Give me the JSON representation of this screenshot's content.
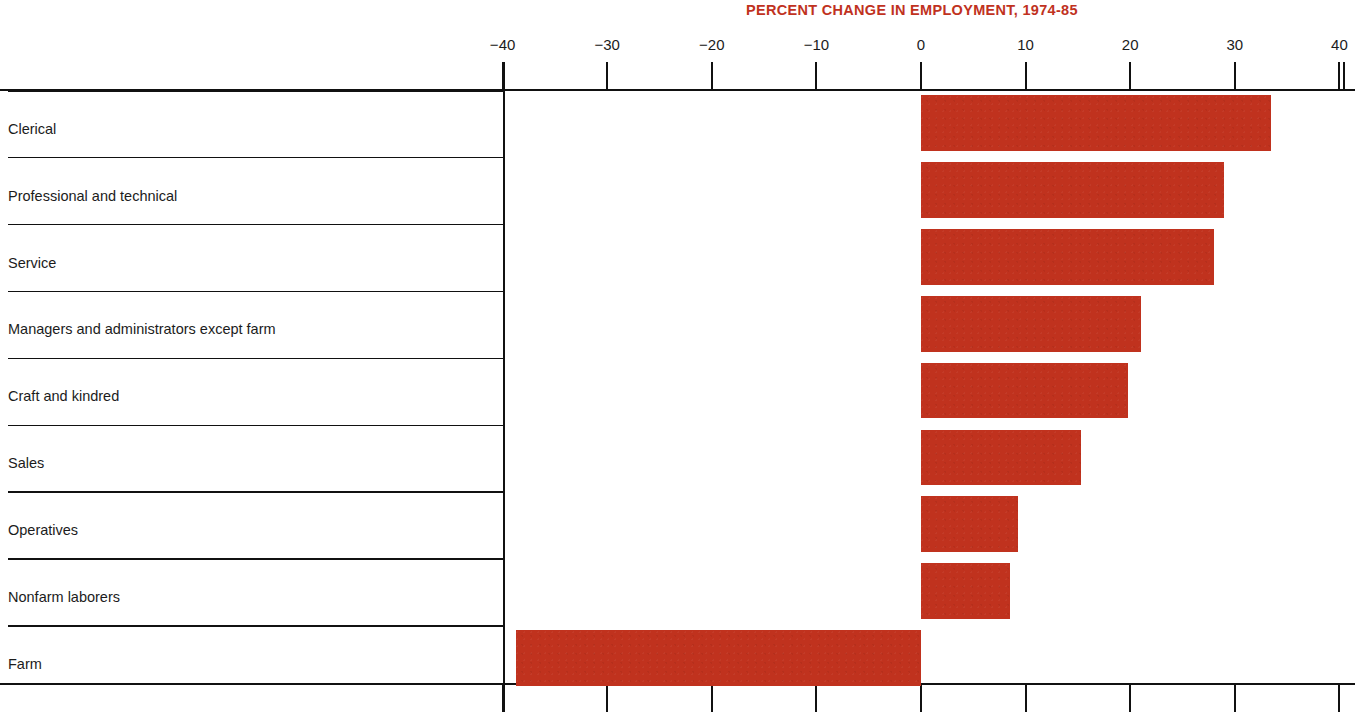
{
  "chart_data": {
    "type": "bar",
    "orientation": "horizontal",
    "title": "PERCENT CHANGE IN EMPLOYMENT, 1974-85",
    "xlabel": "",
    "ylabel": "",
    "xlim": [
      -40,
      40
    ],
    "grid": false,
    "legend": "none",
    "title_color": "#C0321E",
    "bar_color": "#C0321E",
    "axis_color": "#111111",
    "tick_labels": [
      "−40",
      "−30",
      "−20",
      "−10",
      "0",
      "10",
      "20",
      "30",
      "40"
    ],
    "tick_values": [
      -40,
      -30,
      -20,
      -10,
      0,
      10,
      20,
      30,
      40
    ],
    "categories": [
      "Clerical",
      "Professional and technical",
      "Service",
      "Managers and administrators except farm",
      "Craft and kindred",
      "Sales",
      "Operatives",
      "Nonfarm laborers",
      "Farm"
    ],
    "values": [
      33.5,
      29.0,
      28.0,
      21.0,
      19.8,
      15.3,
      9.3,
      8.5,
      -38.7
    ]
  }
}
